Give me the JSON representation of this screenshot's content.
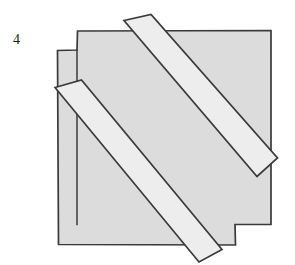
{
  "figure": {
    "label": "4",
    "caption_number": "4",
    "colors": {
      "background": "#ffffff",
      "square_fill": "#dcdcdc",
      "band_fill": "#ededed",
      "outline": "#3a3a3a",
      "label_color": "#1a1a1a"
    },
    "shapes": {
      "square_upper": {
        "name": "upper-right-square",
        "points": "76,30 271,30 271,225 76,225",
        "fill": "#dcdcdc"
      },
      "square_lower": {
        "name": "lower-left-square",
        "points": "58,50 235,50 235,245 58,245",
        "fill": "#dcdcdc"
      },
      "silhouette": {
        "name": "combined-outline",
        "points": "76,30 271,30 271,225 235,225 235,245 58,245 58,50 76,50",
        "fill": "#dcdcdc"
      },
      "band_upper": {
        "name": "upper-diagonal-band",
        "points": "124,20 152,14 278,158 258,176",
        "fill": "#ededed"
      },
      "band_lower": {
        "name": "lower-diagonal-band",
        "points": "55,87 82,80 222,250 200,262",
        "fill": "#ededed"
      }
    }
  }
}
